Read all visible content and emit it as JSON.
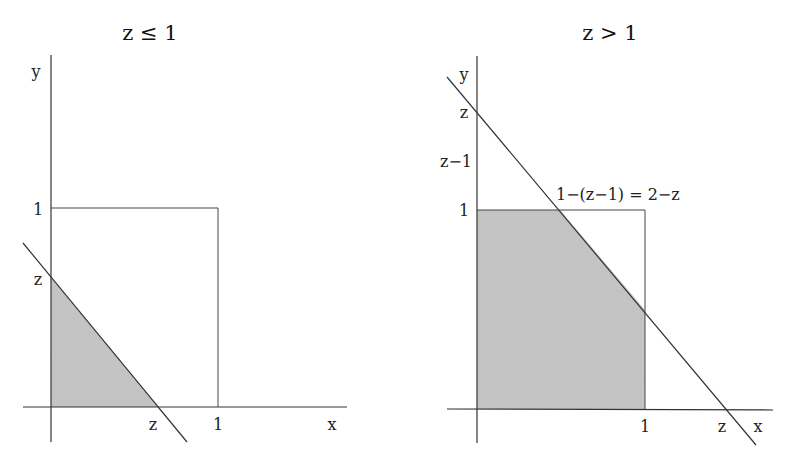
{
  "panels": [
    {
      "title": "z ≤ 1",
      "labels": {
        "y_axis": "y",
        "x_axis": "x",
        "y_one": "1",
        "x_one": "1",
        "y_z": "z",
        "x_z": "z"
      },
      "shaded_region": "triangle x+y ≤ z inside unit square"
    },
    {
      "title": "z > 1",
      "labels": {
        "y_axis": "y",
        "x_axis": "x",
        "y_one": "1",
        "x_one": "1",
        "y_z": "z",
        "x_z": "z",
        "y_zm1": "z−1",
        "annotation": "1−(z−1) = 2−z"
      },
      "shaded_region": "unit square below line x+y = z"
    }
  ],
  "colors": {
    "shade": "#c4c4c4",
    "line": "#333333"
  }
}
